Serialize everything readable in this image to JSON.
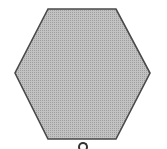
{
  "diagram": {
    "shape": "regular-hexagon",
    "fill_color": "#b3b3b3",
    "stroke_color": "#4a4a4a",
    "points": "48,9 116,9 150,73 116,139 48,139 15,73",
    "bottom_mark": "partial-circle"
  }
}
